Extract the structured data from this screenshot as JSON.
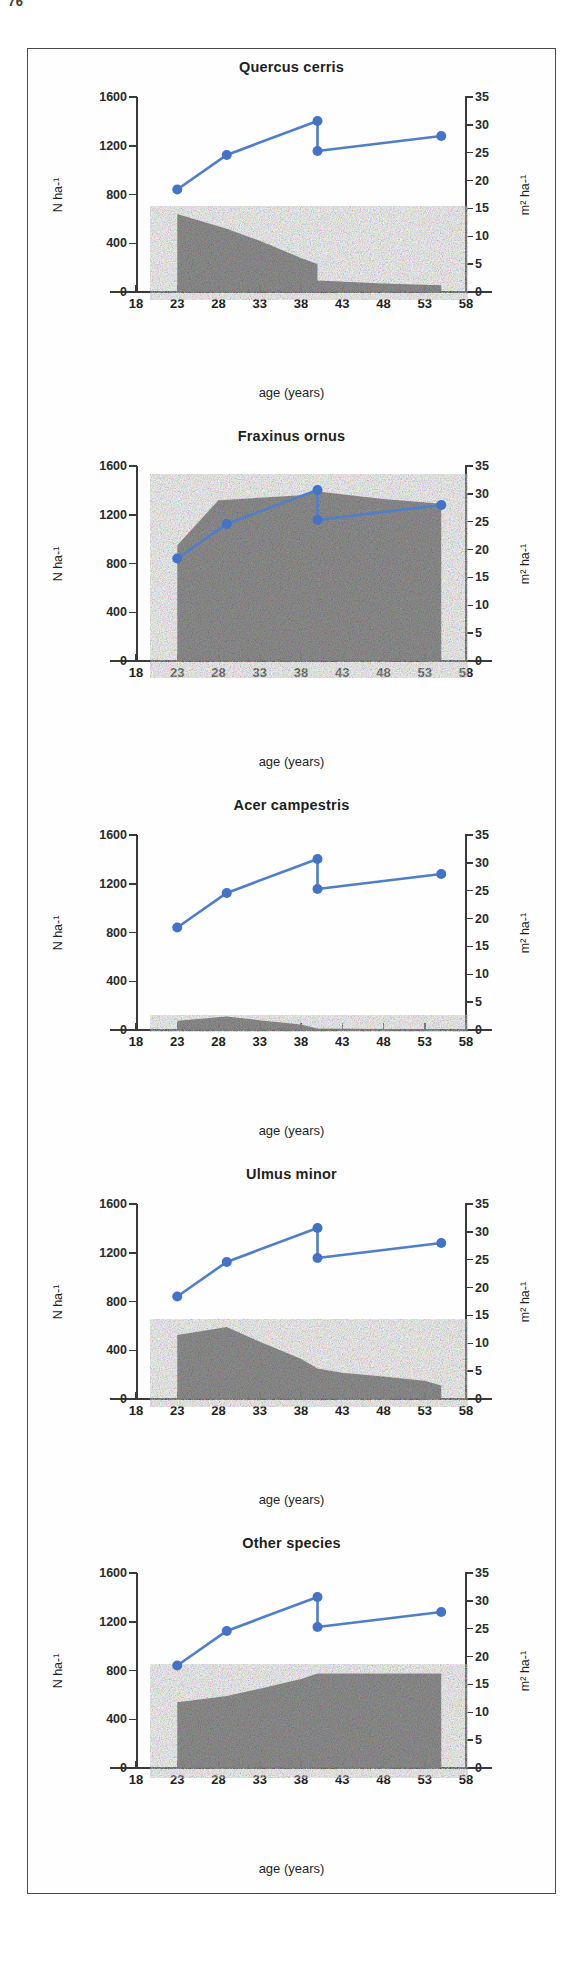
{
  "page_number": "76",
  "figure": {
    "shared": {
      "x_axis_title": "age (years)",
      "y_left_title": "N ha-¹",
      "y_right_title": "m² ha-¹",
      "x_ticks": [
        18,
        23,
        28,
        33,
        38,
        43,
        48,
        53,
        58
      ],
      "y_left_ticks": [
        0,
        400,
        800,
        1200,
        1600
      ],
      "y_right_ticks": [
        0,
        5,
        10,
        15,
        20,
        25,
        30,
        35
      ],
      "line_color": "#4f7fc9",
      "marker_color": "#4472c4",
      "area_color": "#8c8c8c",
      "axis_color": "#3a3a3a"
    },
    "panels": [
      {
        "title": "Quercus cerris",
        "chart_data": {
          "type": "area",
          "title": "Quercus cerris",
          "xlabel": "age (years)",
          "ylabel": "N ha-¹",
          "y2label": "m² ha-¹",
          "xlim": [
            18,
            58
          ],
          "ylim": [
            0,
            1600
          ],
          "y2lim": [
            0,
            35
          ],
          "grid": false,
          "legend": "none",
          "series": [
            {
              "name": "stem density (N ha-¹)",
              "render": "area",
              "axis": "left",
              "x": [
                23,
                23,
                29,
                33,
                38,
                40,
                40,
                48,
                55,
                55
              ],
              "values": [
                0,
                640,
                520,
                420,
                280,
                230,
                95,
                70,
                55,
                0
              ]
            },
            {
              "name": "basal area (m² ha-¹)",
              "render": "line-markers",
              "axis": "right",
              "x": [
                23,
                29,
                40,
                40,
                55
              ],
              "values": [
                18.4,
                24.6,
                30.7,
                25.3,
                28.0
              ]
            }
          ]
        }
      },
      {
        "title": "Fraxinus ornus",
        "chart_data": {
          "type": "area",
          "title": "Fraxinus ornus",
          "xlabel": "age (years)",
          "ylabel": "N ha-¹",
          "y2label": "m² ha-¹",
          "xlim": [
            18,
            58
          ],
          "ylim": [
            0,
            1600
          ],
          "y2lim": [
            0,
            35
          ],
          "grid": false,
          "legend": "none",
          "series": [
            {
              "name": "stem density (N ha-¹)",
              "render": "area",
              "axis": "left",
              "x": [
                23,
                23,
                28,
                33,
                38,
                40,
                48,
                55,
                55
              ],
              "values": [
                0,
                950,
                1320,
                1340,
                1360,
                1390,
                1330,
                1290,
                0
              ]
            },
            {
              "name": "basal area (m² ha-¹)",
              "render": "line-markers",
              "axis": "right",
              "x": [
                23,
                29,
                40,
                40,
                55
              ],
              "values": [
                18.4,
                24.6,
                30.7,
                25.3,
                28.0
              ]
            }
          ]
        }
      },
      {
        "title": "Acer campestris",
        "chart_data": {
          "type": "area",
          "title": "Acer campestris",
          "xlabel": "age (years)",
          "ylabel": "N ha-¹",
          "y2label": "m² ha-¹",
          "xlim": [
            18,
            58
          ],
          "ylim": [
            0,
            1600
          ],
          "y2lim": [
            0,
            35
          ],
          "grid": false,
          "legend": "none",
          "series": [
            {
              "name": "stem density (N ha-¹)",
              "render": "area",
              "axis": "left",
              "x": [
                23,
                23,
                29,
                33,
                38,
                40,
                48,
                55,
                55
              ],
              "values": [
                0,
                75,
                110,
                80,
                45,
                12,
                8,
                6,
                0
              ]
            },
            {
              "name": "basal area (m² ha-¹)",
              "render": "line-markers",
              "axis": "right",
              "x": [
                23,
                29,
                40,
                40,
                55
              ],
              "values": [
                18.4,
                24.6,
                30.7,
                25.3,
                28.0
              ]
            }
          ]
        }
      },
      {
        "title": "Ulmus minor",
        "chart_data": {
          "type": "area",
          "title": "Ulmus minor",
          "xlabel": "age (years)",
          "ylabel": "N ha-¹",
          "y2label": "m² ha-¹",
          "xlim": [
            18,
            58
          ],
          "ylim": [
            0,
            1600
          ],
          "y2lim": [
            0,
            35
          ],
          "grid": false,
          "legend": "none",
          "series": [
            {
              "name": "stem density (N ha-¹)",
              "render": "area",
              "axis": "left",
              "x": [
                23,
                23,
                29,
                33,
                38,
                40,
                43,
                48,
                53,
                55,
                55
              ],
              "values": [
                0,
                525,
                590,
                470,
                330,
                250,
                215,
                185,
                150,
                110,
                0
              ]
            },
            {
              "name": "basal area (m² ha-¹)",
              "render": "line-markers",
              "axis": "right",
              "x": [
                23,
                29,
                40,
                40,
                55
              ],
              "values": [
                18.4,
                24.6,
                30.7,
                25.3,
                28.0
              ]
            }
          ]
        }
      },
      {
        "title": "Other species",
        "chart_data": {
          "type": "area",
          "title": "Other species",
          "xlabel": "age (years)",
          "ylabel": "N ha-¹",
          "y2label": "m² ha-¹",
          "xlim": [
            18,
            58
          ],
          "ylim": [
            0,
            1600
          ],
          "y2lim": [
            0,
            35
          ],
          "grid": false,
          "legend": "none",
          "series": [
            {
              "name": "stem density (N ha-¹)",
              "render": "area",
              "axis": "left",
              "x": [
                23,
                23,
                29,
                33,
                38,
                40,
                48,
                55,
                55
              ],
              "values": [
                0,
                540,
                590,
                650,
                730,
                775,
                775,
                775,
                0
              ]
            },
            {
              "name": "basal area (m² ha-¹)",
              "render": "line-markers",
              "axis": "right",
              "x": [
                23,
                29,
                40,
                40,
                55
              ],
              "values": [
                18.4,
                24.6,
                30.7,
                25.3,
                28.0
              ]
            }
          ]
        }
      }
    ]
  }
}
